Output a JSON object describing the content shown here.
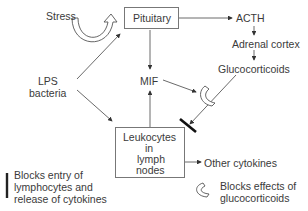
{
  "diagram": {
    "nodes": {
      "stress": "Stress",
      "pituitary": "Pituitary",
      "acth": "ACTH",
      "adrenal": "Adrenal cortex",
      "gluco": "Glucocorticoids",
      "lps_1": "LPS",
      "lps_2": "bacteria",
      "mif": "MIF",
      "leuko_1": "Leukocytes",
      "leuko_2": "in",
      "leuko_3": "lymph",
      "leuko_4": "nodes",
      "other": "Other cytokines"
    },
    "legend": {
      "bar_1": "Blocks entry of",
      "bar_2": "lymphocytes and",
      "bar_3": "release of cytokines",
      "curve_1": "Blocks effects of",
      "curve_2": "glucocorticoids"
    },
    "edges": [
      {
        "from": "Stress",
        "to": "Pituitary",
        "style": "curved-hollow-arrow"
      },
      {
        "from": "LPS bacteria",
        "to": "Pituitary"
      },
      {
        "from": "LPS bacteria",
        "to": "Leukocytes in lymph nodes"
      },
      {
        "from": "Pituitary",
        "to": "ACTH"
      },
      {
        "from": "ACTH",
        "to": "Adrenal cortex"
      },
      {
        "from": "Adrenal cortex",
        "to": "Glucocorticoids"
      },
      {
        "from": "Pituitary",
        "to": "MIF"
      },
      {
        "from": "Leukocytes in lymph nodes",
        "to": "MIF"
      },
      {
        "from": "MIF",
        "to": "glucocorticoid-block-symbol"
      },
      {
        "from": "Glucocorticoids",
        "to": "Leukocytes in lymph nodes",
        "blocked": true
      },
      {
        "from": "Leukocytes in lymph nodes",
        "to": "Other cytokines"
      }
    ]
  }
}
